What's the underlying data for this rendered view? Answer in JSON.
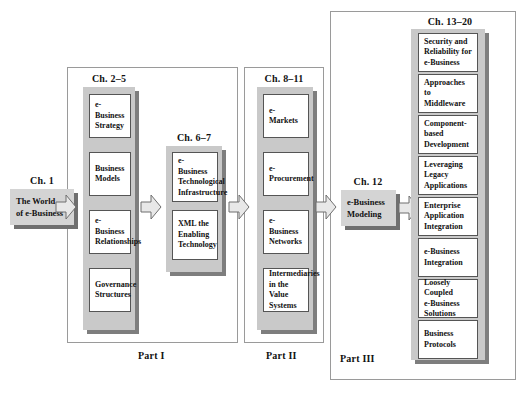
{
  "diagram": {
    "colors": {
      "panel_grey": "#c9c9c9",
      "panel_shadow": "#7e7e7e",
      "box_white": "#ffffff",
      "box_border": "#555555",
      "solo_grey": "#d4d4d4",
      "solo_shadow": "#6f6f6f",
      "frame_border": "#9a9a9a",
      "arrow_fill": "#e8e8e8",
      "arrow_stroke": "#6f6f6f",
      "text": "#111111"
    }
  },
  "intro": {
    "chapter_label": "Ch. 1",
    "box_label": "The World\nof e-Business"
  },
  "parts": [
    {
      "id": "part-1",
      "label": "Part I",
      "groups": [
        {
          "id": "ch-2-5",
          "chapter_label": "Ch. 2–5",
          "items": [
            {
              "label": "e-Business\nStrategy"
            },
            {
              "label": "Business\nModels"
            },
            {
              "label": "e-Business\nRelationships"
            },
            {
              "label": "Governance\nStructures"
            }
          ]
        },
        {
          "id": "ch-6-7",
          "chapter_label": "Ch. 6–7",
          "items": [
            {
              "label": "e-Business\nTechnological\nInfrastructure"
            },
            {
              "label": "XML the\nEnabling\nTechnology"
            }
          ]
        }
      ]
    },
    {
      "id": "part-2",
      "label": "Part II",
      "groups": [
        {
          "id": "ch-8-11",
          "chapter_label": "Ch. 8–11",
          "items": [
            {
              "label": "e-Markets"
            },
            {
              "label": "e-Procurement"
            },
            {
              "label": "e-Business\nNetworks"
            },
            {
              "label": "Intermediaries\nin the Value\nSystems"
            }
          ]
        }
      ]
    },
    {
      "id": "part-3",
      "label": "Part III",
      "groups": [
        {
          "id": "ch-13-20",
          "chapter_label": "Ch. 13–20",
          "items": [
            {
              "label": "Security and\nReliability for\ne-Business"
            },
            {
              "label": "Approaches to\nMiddleware"
            },
            {
              "label": "Component-\nbased\nDevelopment"
            },
            {
              "label": "Leveraging\nLegacy\nApplications"
            },
            {
              "label": "Enterprise\nApplication\nIntegration"
            },
            {
              "label": "e-Business\nIntegration"
            },
            {
              "label": "Loosely\nCoupled\ne-Business\nSolutions"
            },
            {
              "label": "Business\nProtocols"
            }
          ]
        }
      ]
    }
  ],
  "modeling": {
    "chapter_label": "Ch. 12",
    "box_label": "e-Business\nModeling"
  },
  "arrows": [
    {
      "id": "arrow-intro-to-part1",
      "direction": "right"
    },
    {
      "id": "arrow-ch25-to-ch67",
      "direction": "right"
    },
    {
      "id": "arrow-part1-to-part2",
      "direction": "right"
    },
    {
      "id": "arrow-part2-to-ch12",
      "direction": "right"
    },
    {
      "id": "arrow-ch12-to-part3",
      "direction": "right"
    }
  ]
}
